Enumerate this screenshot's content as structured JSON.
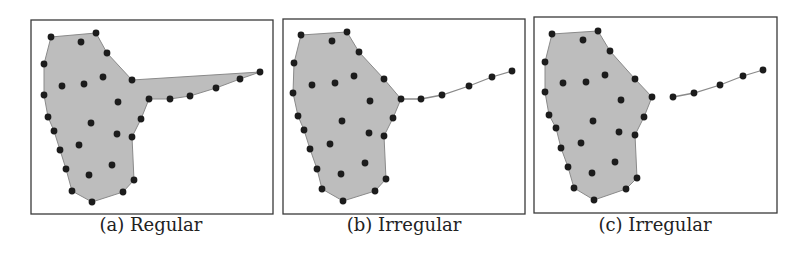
{
  "figure": {
    "colors": {
      "hull_fill": "#bdbdbd",
      "hull_edge": "#8a8a8a",
      "point": "#1c1c1c",
      "frame": "#3a3a3a",
      "background": "#ffffff"
    },
    "panels": [
      {
        "id": "a",
        "caption": "(a) Regular",
        "frame": [
          31,
          20,
          242,
          194
        ],
        "caption_center_x": 151,
        "hull": [
          [
            51,
            37
          ],
          [
            96,
            33
          ],
          [
            107,
            53
          ],
          [
            132,
            80
          ],
          [
            260,
            72
          ],
          [
            240,
            79
          ],
          [
            216,
            88
          ],
          [
            190,
            96
          ],
          [
            170,
            99
          ],
          [
            149,
            99
          ],
          [
            141,
            119
          ],
          [
            132,
            137
          ],
          [
            134,
            180
          ],
          [
            123,
            192
          ],
          [
            92,
            202
          ],
          [
            72,
            191
          ],
          [
            66,
            169
          ],
          [
            60,
            150
          ],
          [
            54,
            131
          ],
          [
            48,
            117
          ],
          [
            44,
            95
          ],
          [
            44,
            64
          ]
        ],
        "tail": [],
        "points": [
          [
            51,
            37
          ],
          [
            96,
            33
          ],
          [
            81,
            42
          ],
          [
            107,
            53
          ],
          [
            44,
            64
          ],
          [
            103,
            77
          ],
          [
            132,
            80
          ],
          [
            62,
            86
          ],
          [
            84,
            84
          ],
          [
            44,
            95
          ],
          [
            118,
            102
          ],
          [
            149,
            99
          ],
          [
            170,
            99
          ],
          [
            190,
            96
          ],
          [
            216,
            88
          ],
          [
            240,
            79
          ],
          [
            260,
            72
          ],
          [
            48,
            117
          ],
          [
            91,
            123
          ],
          [
            141,
            119
          ],
          [
            54,
            131
          ],
          [
            117,
            134
          ],
          [
            132,
            137
          ],
          [
            79,
            145
          ],
          [
            60,
            150
          ],
          [
            112,
            165
          ],
          [
            66,
            169
          ],
          [
            89,
            175
          ],
          [
            134,
            180
          ],
          [
            72,
            191
          ],
          [
            123,
            192
          ],
          [
            92,
            202
          ]
        ]
      },
      {
        "id": "b",
        "caption": "(b) Irregular",
        "frame": [
          283,
          19,
          242,
          195
        ],
        "caption_center_x": 404,
        "hull": [
          [
            301,
            35
          ],
          [
            347,
            32
          ],
          [
            359,
            52
          ],
          [
            384,
            79
          ],
          [
            401,
            99
          ],
          [
            393,
            118
          ],
          [
            384,
            136
          ],
          [
            386,
            179
          ],
          [
            375,
            191
          ],
          [
            343,
            201
          ],
          [
            322,
            189
          ],
          [
            317,
            169
          ],
          [
            310,
            149
          ],
          [
            304,
            130
          ],
          [
            298,
            116
          ],
          [
            293,
            93
          ],
          [
            294,
            63
          ]
        ],
        "tail": [
          [
            401,
            99
          ],
          [
            421,
            99
          ],
          [
            442,
            95
          ],
          [
            469,
            86
          ],
          [
            492,
            77
          ],
          [
            512,
            71
          ]
        ],
        "points": [
          [
            301,
            35
          ],
          [
            347,
            32
          ],
          [
            332,
            41
          ],
          [
            359,
            52
          ],
          [
            294,
            63
          ],
          [
            354,
            76
          ],
          [
            384,
            79
          ],
          [
            312,
            85
          ],
          [
            335,
            83
          ],
          [
            293,
            93
          ],
          [
            370,
            101
          ],
          [
            401,
            99
          ],
          [
            421,
            99
          ],
          [
            442,
            95
          ],
          [
            469,
            86
          ],
          [
            492,
            77
          ],
          [
            512,
            71
          ],
          [
            298,
            116
          ],
          [
            342,
            121
          ],
          [
            393,
            118
          ],
          [
            304,
            130
          ],
          [
            369,
            133
          ],
          [
            384,
            136
          ],
          [
            330,
            144
          ],
          [
            310,
            149
          ],
          [
            365,
            163
          ],
          [
            317,
            169
          ],
          [
            341,
            174
          ],
          [
            386,
            179
          ],
          [
            322,
            189
          ],
          [
            375,
            191
          ],
          [
            343,
            201
          ]
        ]
      },
      {
        "id": "c",
        "caption": "(c) Irregular",
        "frame": [
          534,
          17,
          243,
          196
        ],
        "caption_center_x": 655,
        "hull": [
          [
            552,
            34
          ],
          [
            598,
            31
          ],
          [
            610,
            51
          ],
          [
            635,
            79
          ],
          [
            652,
            97
          ],
          [
            644,
            117
          ],
          [
            635,
            135
          ],
          [
            637,
            178
          ],
          [
            626,
            189
          ],
          [
            594,
            200
          ],
          [
            574,
            188
          ],
          [
            568,
            167
          ],
          [
            561,
            148
          ],
          [
            556,
            128
          ],
          [
            549,
            115
          ],
          [
            545,
            92
          ],
          [
            545,
            62
          ]
        ],
        "tail": [
          [
            673,
            97
          ],
          [
            694,
            93
          ],
          [
            720,
            85
          ],
          [
            743,
            76
          ],
          [
            763,
            70
          ]
        ],
        "points": [
          [
            552,
            34
          ],
          [
            598,
            31
          ],
          [
            583,
            40
          ],
          [
            610,
            51
          ],
          [
            545,
            62
          ],
          [
            605,
            75
          ],
          [
            635,
            79
          ],
          [
            563,
            83
          ],
          [
            586,
            82
          ],
          [
            545,
            92
          ],
          [
            621,
            100
          ],
          [
            652,
            97
          ],
          [
            673,
            97
          ],
          [
            694,
            93
          ],
          [
            720,
            85
          ],
          [
            743,
            76
          ],
          [
            763,
            70
          ],
          [
            549,
            115
          ],
          [
            593,
            121
          ],
          [
            644,
            117
          ],
          [
            556,
            128
          ],
          [
            619,
            132
          ],
          [
            635,
            135
          ],
          [
            581,
            143
          ],
          [
            561,
            148
          ],
          [
            615,
            162
          ],
          [
            568,
            167
          ],
          [
            592,
            173
          ],
          [
            637,
            178
          ],
          [
            574,
            188
          ],
          [
            626,
            189
          ],
          [
            594,
            200
          ]
        ]
      }
    ]
  }
}
